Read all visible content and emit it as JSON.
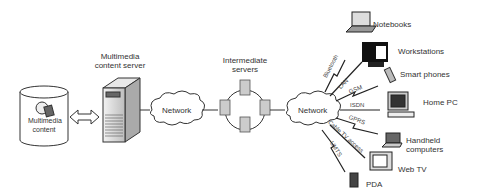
{
  "diagram": {
    "source": {
      "label_line1": "Multimedia",
      "label_line2": "content"
    },
    "server": {
      "label_line1": "Multimedia",
      "label_line2": "content server"
    },
    "network_left": {
      "label": "Network"
    },
    "intermediate": {
      "label_line1": "Intermediate",
      "label_line2": "servers"
    },
    "network_right": {
      "label": "Network"
    },
    "links": {
      "bluetooth": "Bluetooth",
      "lan": "LAN",
      "gsm": "GSM",
      "isdn": "ISDN",
      "gprs": "GPRS",
      "cable": "Cable TV access",
      "umts": "UMTS"
    },
    "devices": {
      "notebooks": "Notebooks",
      "workstations": "Workstations",
      "smartphones": "Smart phones",
      "homepc": "Home PC",
      "handheld_line1": "Handheld",
      "handheld_line2": "computers",
      "webtv": "Web TV",
      "pda": "PDA"
    }
  }
}
